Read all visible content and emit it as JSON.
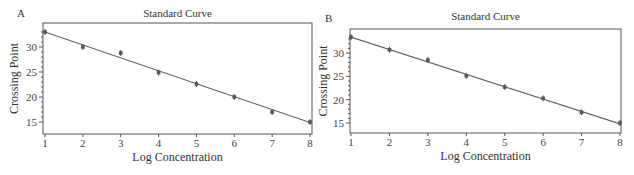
{
  "chart_data": [
    {
      "panel": "A",
      "type": "scatter",
      "title": "Standard Curve",
      "xlabel": "Log Concentration",
      "ylabel": "Crossing Point",
      "x_ticks": [
        1,
        2,
        3,
        4,
        5,
        6,
        7,
        8
      ],
      "y_ticks": [
        15,
        20,
        25,
        30
      ],
      "xlim": [
        1,
        8
      ],
      "ylim": [
        12.5,
        35
      ],
      "grid": false,
      "legend": "none",
      "series": [
        {
          "name": "data",
          "x": [
            1,
            2,
            3,
            4,
            5,
            6,
            7,
            8
          ],
          "y": [
            33.0,
            30.0,
            28.8,
            24.9,
            22.6,
            20.0,
            17.0,
            15.0
          ]
        },
        {
          "name": "fit",
          "type": "line",
          "x": [
            1,
            8
          ],
          "y": [
            33.0,
            14.9
          ]
        }
      ]
    },
    {
      "panel": "B",
      "type": "scatter",
      "title": "Standard Curve",
      "xlabel": "Log Concentration",
      "ylabel": "Crossing Point",
      "x_ticks": [
        1,
        2,
        3,
        4,
        5,
        6,
        7,
        8
      ],
      "y_ticks": [
        15,
        20,
        25,
        30
      ],
      "xlim": [
        1,
        8
      ],
      "ylim": [
        13,
        35.5
      ],
      "grid": false,
      "legend": "none",
      "series": [
        {
          "name": "data",
          "x": [
            1,
            2,
            3,
            4,
            5,
            6,
            7,
            8
          ],
          "y": [
            33.4,
            30.7,
            28.5,
            25.1,
            22.7,
            20.3,
            17.3,
            15.0
          ]
        },
        {
          "name": "fit",
          "type": "line",
          "x": [
            1,
            8
          ],
          "y": [
            33.4,
            14.8
          ]
        }
      ]
    }
  ],
  "panels": [
    {
      "label": "A",
      "title": "Standard Curve",
      "xlabel": "Log Concentration",
      "ylabel": "Crossing Point"
    },
    {
      "label": "B",
      "title": "Standard Curve",
      "xlabel": "Log Concentration",
      "ylabel": "Crossing Point"
    }
  ],
  "colors": {
    "axis": "#555555",
    "line": "#666666",
    "marker": "#555555",
    "text": "#333333"
  }
}
